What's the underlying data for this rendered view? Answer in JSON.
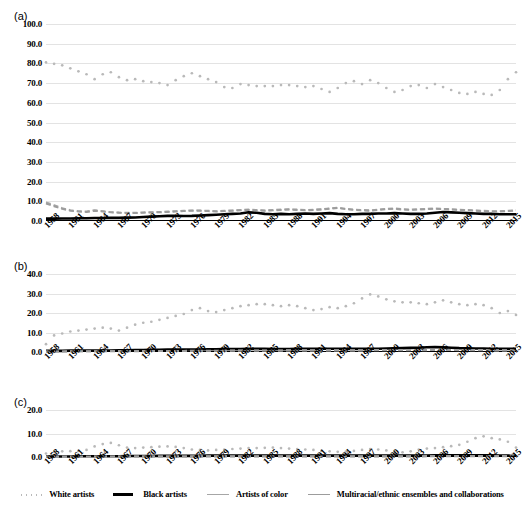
{
  "figure": {
    "panels": [
      {
        "label": "(a)"
      },
      {
        "label": "(b)"
      },
      {
        "label": "(c)"
      }
    ]
  },
  "legend": {
    "position": "bottom-center",
    "items": [
      {
        "label": "White artists",
        "style": "dotted",
        "color": "#b9b9b9"
      },
      {
        "label": "Black artists",
        "style": "solid",
        "color": "#000000"
      },
      {
        "label": "Artists of color",
        "style": "dashed",
        "color": "#a6a6a6"
      },
      {
        "label": "Multiracial/ethnic ensembles and collaborations",
        "style": "dashed",
        "color": "#9c9c9c"
      }
    ]
  },
  "chart_data": [
    {
      "type": "line",
      "title": "(a)",
      "xlabel": "",
      "ylabel": "",
      "xlim": [
        1958,
        2016
      ],
      "ylim": [
        0.0,
        100.0
      ],
      "yticks": [
        "0.0",
        "10.0",
        "20.0",
        "30.0",
        "40.0",
        "50.0",
        "60.0",
        "70.0",
        "80.0",
        "90.0",
        "100.0"
      ],
      "xticks": [
        "1958",
        "1961",
        "1964",
        "1967",
        "1970",
        "1973",
        "1976",
        "1979",
        "1982",
        "1985",
        "1988",
        "1991",
        "1994",
        "1997",
        "2000",
        "2003",
        "2006",
        "2009",
        "2012",
        "2015"
      ],
      "grid": true,
      "x": [
        1958,
        1959,
        1960,
        1961,
        1962,
        1963,
        1964,
        1965,
        1966,
        1967,
        1968,
        1969,
        1970,
        1971,
        1972,
        1973,
        1974,
        1975,
        1976,
        1977,
        1978,
        1979,
        1980,
        1981,
        1982,
        1983,
        1984,
        1985,
        1986,
        1987,
        1988,
        1989,
        1990,
        1991,
        1992,
        1993,
        1994,
        1995,
        1996,
        1997,
        1998,
        1999,
        2000,
        2001,
        2002,
        2003,
        2004,
        2005,
        2006,
        2007,
        2008,
        2009,
        2010,
        2011,
        2012,
        2013,
        2014,
        2015,
        2016
      ],
      "series": [
        {
          "name": "White artists",
          "style": "dotted",
          "color": "#b9b9b9",
          "values": [
            80.5,
            79.8,
            79.0,
            77.5,
            76.0,
            74.5,
            72.0,
            74.5,
            75.5,
            73.0,
            71.5,
            72.0,
            71.0,
            70.5,
            70.0,
            69.0,
            71.5,
            73.5,
            75.0,
            73.5,
            72.0,
            70.5,
            68.0,
            67.5,
            69.5,
            69.0,
            68.5,
            68.5,
            68.5,
            69.0,
            69.0,
            68.5,
            68.0,
            68.5,
            67.0,
            65.5,
            67.5,
            70.0,
            71.0,
            69.5,
            71.5,
            70.0,
            67.5,
            65.5,
            66.5,
            68.5,
            69.0,
            67.5,
            69.5,
            68.0,
            66.5,
            65.0,
            64.5,
            65.5,
            64.5,
            64.0,
            66.5,
            72.0,
            75.5
          ]
        },
        {
          "name": "Black artists",
          "style": "solid",
          "color": "#000000",
          "values": [
            1.2,
            1.2,
            1.3,
            1.3,
            1.4,
            1.4,
            1.5,
            1.5,
            1.6,
            1.6,
            1.7,
            1.8,
            2.0,
            2.2,
            2.4,
            2.6,
            2.6,
            2.5,
            2.6,
            2.8,
            3.0,
            3.2,
            3.4,
            3.6,
            3.8,
            4.4,
            4.2,
            3.6,
            3.4,
            3.6,
            3.4,
            3.6,
            3.8,
            3.6,
            3.8,
            4.0,
            3.6,
            3.4,
            3.4,
            3.6,
            3.6,
            3.8,
            3.8,
            4.0,
            3.8,
            3.6,
            3.6,
            3.8,
            4.2,
            4.6,
            4.4,
            4.2,
            4.0,
            3.8,
            3.6,
            3.6,
            3.4,
            3.4,
            3.4
          ]
        },
        {
          "name": "Artists of color",
          "style": "dashed",
          "color": "#a6a6a6",
          "values": [
            9.5,
            8.0,
            6.5,
            5.5,
            5.0,
            4.8,
            5.5,
            5.0,
            4.5,
            4.3,
            4.2,
            4.2,
            4.4,
            4.5,
            4.6,
            4.8,
            5.0,
            5.2,
            5.4,
            5.4,
            5.2,
            5.0,
            5.2,
            5.4,
            5.6,
            5.8,
            5.6,
            5.4,
            5.6,
            5.8,
            6.0,
            5.8,
            5.6,
            5.8,
            6.0,
            6.4,
            6.8,
            6.2,
            5.8,
            5.6,
            5.4,
            5.8,
            6.2,
            6.4,
            6.0,
            5.8,
            6.0,
            6.2,
            6.4,
            6.2,
            6.0,
            5.8,
            5.6,
            5.4,
            5.2,
            5.0,
            5.0,
            5.2,
            5.5
          ]
        },
        {
          "name": "Multiracial/ethnic ensembles and collaborations",
          "style": "dashed",
          "color": "#9c9c9c",
          "values": [
            8.8,
            7.5,
            6.2,
            5.2,
            4.8,
            4.6,
            5.2,
            4.8,
            4.4,
            4.2,
            4.0,
            4.0,
            4.2,
            4.3,
            4.4,
            4.6,
            4.8,
            5.0,
            5.2,
            5.2,
            5.0,
            4.8,
            5.0,
            5.2,
            5.4,
            5.6,
            5.4,
            5.2,
            5.4,
            5.6,
            5.8,
            5.6,
            5.4,
            5.6,
            5.8,
            6.2,
            6.6,
            6.0,
            5.6,
            5.4,
            5.2,
            5.6,
            6.0,
            6.2,
            5.8,
            5.6,
            5.8,
            6.0,
            6.2,
            6.0,
            5.8,
            5.6,
            5.4,
            5.2,
            5.0,
            4.8,
            4.8,
            5.0,
            5.3
          ]
        }
      ]
    },
    {
      "type": "line",
      "title": "(b)",
      "xlabel": "",
      "ylabel": "",
      "xlim": [
        1958,
        2016
      ],
      "ylim": [
        0.0,
        40.0
      ],
      "yticks": [
        "0.0",
        "10.0",
        "20.0",
        "30.0",
        "40.0"
      ],
      "xticks": [
        "1958",
        "1961",
        "1964",
        "1967",
        "1970",
        "1973",
        "1976",
        "1979",
        "1982",
        "1985",
        "1988",
        "1991",
        "1994",
        "1997",
        "2000",
        "2003",
        "2006",
        "2009",
        "2012",
        "2015"
      ],
      "grid": true,
      "x": [
        1958,
        1959,
        1960,
        1961,
        1962,
        1963,
        1964,
        1965,
        1966,
        1967,
        1968,
        1969,
        1970,
        1971,
        1972,
        1973,
        1974,
        1975,
        1976,
        1977,
        1978,
        1979,
        1980,
        1981,
        1982,
        1983,
        1984,
        1985,
        1986,
        1987,
        1988,
        1989,
        1990,
        1991,
        1992,
        1993,
        1994,
        1995,
        1996,
        1997,
        1998,
        1999,
        2000,
        2001,
        2002,
        2003,
        2004,
        2005,
        2006,
        2007,
        2008,
        2009,
        2010,
        2011,
        2012,
        2013,
        2014,
        2015,
        2016
      ],
      "series": [
        {
          "name": "White artists",
          "style": "dotted",
          "color": "#b9b9b9",
          "values": [
            4.0,
            8.5,
            9.5,
            10.5,
            11.0,
            11.5,
            12.0,
            12.5,
            12.0,
            11.0,
            12.5,
            14.0,
            15.0,
            15.5,
            16.5,
            17.5,
            18.5,
            19.5,
            21.5,
            22.5,
            21.0,
            20.5,
            21.5,
            22.5,
            23.5,
            24.0,
            24.5,
            24.5,
            24.0,
            23.5,
            24.0,
            23.5,
            22.5,
            21.5,
            22.0,
            23.0,
            22.5,
            23.5,
            25.0,
            27.5,
            29.5,
            28.5,
            27.0,
            26.0,
            25.5,
            25.5,
            25.0,
            24.5,
            25.5,
            26.5,
            25.5,
            24.5,
            24.0,
            24.5,
            24.0,
            22.5,
            20.0,
            21.0,
            19.0
          ]
        },
        {
          "name": "Black artists",
          "style": "solid",
          "color": "#000000",
          "values": [
            0.6,
            0.6,
            0.6,
            0.7,
            0.7,
            0.7,
            0.8,
            0.8,
            0.8,
            0.9,
            0.9,
            1.0,
            1.0,
            1.1,
            1.1,
            1.2,
            1.2,
            1.2,
            1.3,
            1.3,
            1.4,
            1.4,
            1.5,
            1.5,
            1.5,
            1.6,
            1.6,
            1.6,
            1.5,
            1.5,
            1.5,
            1.6,
            1.6,
            1.6,
            1.7,
            1.7,
            1.7,
            1.6,
            1.6,
            1.6,
            1.6,
            1.7,
            1.8,
            1.9,
            2.0,
            2.1,
            2.2,
            2.4,
            2.5,
            2.4,
            2.2,
            2.0,
            1.9,
            1.8,
            1.8,
            1.7,
            1.6,
            1.6,
            1.6
          ]
        },
        {
          "name": "Artists of color",
          "style": "dashed",
          "color": "#a6a6a6",
          "values": [
            0.3,
            0.3,
            0.3,
            0.4,
            0.4,
            0.4,
            0.4,
            0.4,
            0.5,
            0.5,
            0.5,
            0.5,
            0.5,
            0.6,
            0.6,
            0.6,
            0.6,
            0.6,
            0.7,
            0.7,
            0.7,
            0.7,
            0.7,
            0.8,
            0.8,
            0.8,
            0.8,
            0.8,
            0.8,
            0.8,
            0.9,
            0.9,
            0.9,
            0.9,
            0.9,
            0.9,
            0.9,
            0.9,
            0.9,
            0.9,
            1.0,
            1.0,
            1.0,
            1.0,
            1.0,
            1.0,
            1.0,
            1.0,
            1.1,
            1.1,
            1.1,
            1.0,
            1.0,
            1.0,
            1.0,
            0.9,
            0.9,
            0.9,
            0.9
          ]
        },
        {
          "name": "Multiracial/ethnic ensembles and collaborations",
          "style": "dashed",
          "color": "#9c9c9c",
          "values": [
            0.2,
            0.2,
            0.2,
            0.3,
            0.3,
            0.3,
            0.3,
            0.3,
            0.4,
            0.4,
            0.4,
            0.4,
            0.4,
            0.5,
            0.5,
            0.5,
            0.5,
            0.5,
            0.6,
            0.6,
            0.6,
            0.6,
            0.6,
            0.7,
            0.7,
            0.7,
            0.7,
            0.7,
            0.7,
            0.7,
            0.8,
            0.8,
            0.8,
            0.8,
            0.8,
            0.8,
            0.8,
            0.8,
            0.8,
            0.8,
            0.9,
            0.9,
            0.9,
            0.9,
            0.9,
            0.9,
            0.9,
            0.9,
            1.0,
            1.0,
            1.0,
            0.9,
            0.9,
            0.9,
            0.9,
            0.8,
            0.8,
            0.8,
            0.8
          ]
        }
      ]
    },
    {
      "type": "line",
      "title": "(c)",
      "xlabel": "",
      "ylabel": "",
      "xlim": [
        1958,
        2016
      ],
      "ylim": [
        0.0,
        20.0
      ],
      "yticks": [
        "0.0",
        "10.0",
        "20.0"
      ],
      "xticks": [
        "1958",
        "1961",
        "1964",
        "1967",
        "1970",
        "1973",
        "1976",
        "1979",
        "1982",
        "1985",
        "1988",
        "1991",
        "1994",
        "1997",
        "2000",
        "2003",
        "2006",
        "2009",
        "2012",
        "2015"
      ],
      "grid": true,
      "x": [
        1958,
        1959,
        1960,
        1961,
        1962,
        1963,
        1964,
        1965,
        1966,
        1967,
        1968,
        1969,
        1970,
        1971,
        1972,
        1973,
        1974,
        1975,
        1976,
        1977,
        1978,
        1979,
        1980,
        1981,
        1982,
        1983,
        1984,
        1985,
        1986,
        1987,
        1988,
        1989,
        1990,
        1991,
        1992,
        1993,
        1994,
        1995,
        1996,
        1997,
        1998,
        1999,
        2000,
        2001,
        2002,
        2003,
        2004,
        2005,
        2006,
        2007,
        2008,
        2009,
        2010,
        2011,
        2012,
        2013,
        2014,
        2015,
        2016
      ],
      "series": [
        {
          "name": "White artists",
          "style": "dotted",
          "color": "#b9b9b9",
          "values": [
            1.5,
            2.2,
            2.4,
            2.5,
            2.6,
            3.0,
            4.5,
            5.5,
            6.0,
            5.0,
            4.0,
            3.8,
            4.0,
            4.2,
            4.4,
            4.5,
            4.3,
            3.8,
            3.2,
            3.0,
            2.8,
            3.0,
            3.2,
            3.4,
            3.6,
            3.8,
            3.8,
            3.9,
            4.0,
            3.8,
            3.6,
            3.4,
            3.2,
            3.0,
            2.6,
            2.4,
            2.2,
            2.3,
            2.6,
            3.0,
            3.4,
            3.2,
            2.8,
            2.4,
            2.0,
            2.4,
            3.2,
            3.6,
            3.8,
            4.2,
            4.6,
            5.2,
            6.5,
            8.0,
            8.8,
            8.0,
            7.5,
            6.5,
            4.0
          ]
        },
        {
          "name": "Black artists",
          "style": "solid",
          "color": "#000000",
          "values": [
            0.2,
            0.2,
            0.2,
            0.2,
            0.3,
            0.3,
            0.3,
            0.3,
            0.3,
            0.3,
            0.4,
            0.4,
            0.4,
            0.4,
            0.5,
            0.5,
            0.5,
            0.5,
            0.5,
            0.5,
            0.6,
            0.6,
            0.6,
            0.6,
            0.6,
            0.6,
            0.6,
            0.6,
            0.6,
            0.6,
            0.6,
            0.6,
            0.6,
            0.6,
            0.6,
            0.6,
            0.6,
            0.6,
            0.6,
            0.6,
            0.6,
            0.6,
            0.6,
            0.6,
            0.6,
            0.6,
            0.6,
            0.6,
            0.7,
            0.7,
            0.7,
            0.7,
            0.7,
            0.7,
            0.7,
            0.7,
            0.6,
            0.6,
            0.6
          ]
        },
        {
          "name": "Artists of color",
          "style": "dashed",
          "color": "#a6a6a6",
          "values": [
            0.1,
            0.1,
            0.1,
            0.1,
            0.1,
            0.1,
            0.2,
            0.2,
            0.2,
            0.2,
            0.2,
            0.2,
            0.2,
            0.2,
            0.2,
            0.2,
            0.2,
            0.2,
            0.3,
            0.3,
            0.3,
            0.3,
            0.3,
            0.3,
            0.3,
            0.3,
            0.3,
            0.3,
            0.3,
            0.3,
            0.3,
            0.3,
            0.3,
            0.3,
            0.3,
            0.3,
            0.3,
            0.3,
            0.3,
            0.3,
            0.3,
            0.3,
            0.3,
            0.3,
            0.3,
            0.3,
            0.3,
            0.4,
            0.4,
            0.4,
            0.4,
            0.4,
            0.4,
            0.4,
            0.4,
            0.4,
            0.4,
            0.4,
            1.6
          ]
        },
        {
          "name": "Multiracial/ethnic ensembles and collaborations",
          "style": "dashed",
          "color": "#9c9c9c",
          "values": [
            0.1,
            0.1,
            0.1,
            0.1,
            0.1,
            0.1,
            0.1,
            0.1,
            0.1,
            0.1,
            0.2,
            0.2,
            0.2,
            0.2,
            0.2,
            0.2,
            0.2,
            0.2,
            0.2,
            0.2,
            0.2,
            0.2,
            0.2,
            0.2,
            0.2,
            0.2,
            0.2,
            0.2,
            0.2,
            0.2,
            0.2,
            0.2,
            0.2,
            0.2,
            0.2,
            0.2,
            0.2,
            0.2,
            0.2,
            0.2,
            0.2,
            0.2,
            0.2,
            0.2,
            0.2,
            0.2,
            0.2,
            0.3,
            0.3,
            0.3,
            0.3,
            0.3,
            0.3,
            0.3,
            0.3,
            0.3,
            0.3,
            0.3,
            1.4
          ]
        }
      ]
    }
  ]
}
